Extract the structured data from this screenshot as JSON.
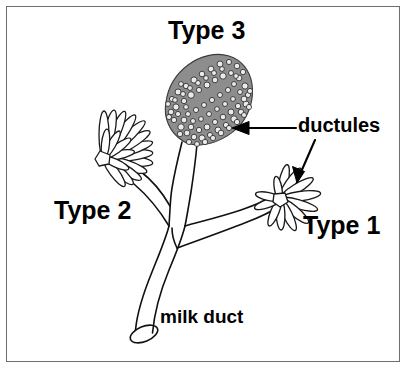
{
  "figure": {
    "background_color": "#ffffff",
    "frame_color": "#6e6e6e",
    "ink_color": "#000000",
    "cluster_fill_color": "#808080"
  },
  "labels": {
    "type3": "Type 3",
    "type2": "Type 2",
    "type1": "Type 1",
    "ductules": "ductules",
    "milk_duct": "milk duct"
  },
  "annotations": {
    "arrow_to_type3": "arrow pointing left to Type 3 cluster",
    "arrow_to_type1": "arrow pointing down-left to Type 1 lobule"
  },
  "structures": {
    "type3": {
      "name": "Type 3 lobule",
      "description": "dense mottled cluster of many small ductules"
    },
    "type2": {
      "name": "Type 2 lobule",
      "description": "rosette of numerous elongated finger-like ductules"
    },
    "type1": {
      "name": "Type 1 lobule",
      "description": "small rosette of few petal-shaped ductules"
    },
    "milk_duct": {
      "name": "milk duct",
      "description": "main tubular duct with open elliptical mouth at base"
    }
  }
}
